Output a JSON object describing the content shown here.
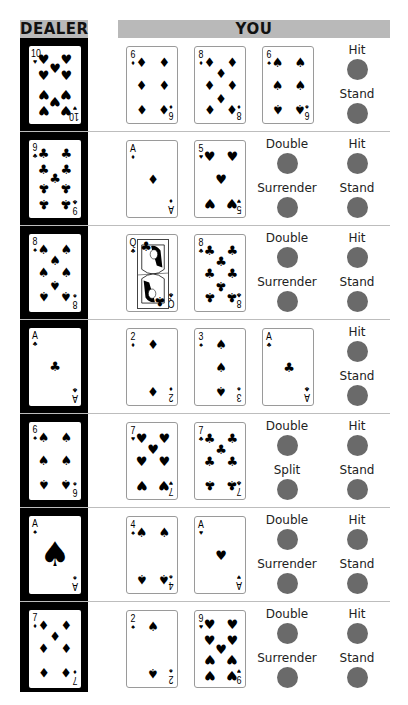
{
  "headers": {
    "dealer": "DEALER",
    "you": "YOU"
  },
  "colors": {
    "button": "#6a6a6a",
    "header_bg": "#b9b9b9",
    "dealer_bg": "#000000"
  },
  "suit_glyphs": {
    "hearts": "♥",
    "diamonds": "♦",
    "clubs": "♣",
    "spades": "♠"
  },
  "rows": [
    {
      "dealer": {
        "rank": "10",
        "suit": "hearts"
      },
      "player": [
        {
          "rank": "6",
          "suit": "diamonds"
        },
        {
          "rank": "8",
          "suit": "diamonds"
        },
        {
          "rank": "6",
          "suit": "spades"
        }
      ],
      "actions": [
        {
          "label": "Hit",
          "col": 1,
          "slot": 0
        },
        {
          "label": "Stand",
          "col": 1,
          "slot": 1
        }
      ]
    },
    {
      "dealer": {
        "rank": "9",
        "suit": "clubs"
      },
      "player": [
        {
          "rank": "A",
          "suit": "diamonds"
        },
        {
          "rank": "5",
          "suit": "hearts"
        }
      ],
      "actions": [
        {
          "label": "Double",
          "col": 0,
          "slot": 0
        },
        {
          "label": "Hit",
          "col": 1,
          "slot": 0
        },
        {
          "label": "Surrender",
          "col": 0,
          "slot": 1
        },
        {
          "label": "Stand",
          "col": 1,
          "slot": 1
        }
      ]
    },
    {
      "dealer": {
        "rank": "8",
        "suit": "spades"
      },
      "player": [
        {
          "rank": "Q",
          "suit": "clubs"
        },
        {
          "rank": "8",
          "suit": "clubs"
        }
      ],
      "actions": [
        {
          "label": "Double",
          "col": 0,
          "slot": 0
        },
        {
          "label": "Hit",
          "col": 1,
          "slot": 0
        },
        {
          "label": "Surrender",
          "col": 0,
          "slot": 1
        },
        {
          "label": "Stand",
          "col": 1,
          "slot": 1
        }
      ]
    },
    {
      "dealer": {
        "rank": "A",
        "suit": "clubs"
      },
      "player": [
        {
          "rank": "2",
          "suit": "diamonds"
        },
        {
          "rank": "3",
          "suit": "spades"
        },
        {
          "rank": "A",
          "suit": "clubs"
        }
      ],
      "actions": [
        {
          "label": "Hit",
          "col": 1,
          "slot": 0
        },
        {
          "label": "Stand",
          "col": 1,
          "slot": 1
        }
      ]
    },
    {
      "dealer": {
        "rank": "6",
        "suit": "spades"
      },
      "player": [
        {
          "rank": "7",
          "suit": "hearts"
        },
        {
          "rank": "7",
          "suit": "clubs"
        }
      ],
      "actions": [
        {
          "label": "Double",
          "col": 0,
          "slot": 0
        },
        {
          "label": "Hit",
          "col": 1,
          "slot": 0
        },
        {
          "label": "Split",
          "col": 0,
          "slot": 1
        },
        {
          "label": "Stand",
          "col": 1,
          "slot": 1
        }
      ]
    },
    {
      "dealer": {
        "rank": "A",
        "suit": "spades",
        "big_ace": true
      },
      "player": [
        {
          "rank": "4",
          "suit": "spades"
        },
        {
          "rank": "A",
          "suit": "hearts"
        }
      ],
      "actions": [
        {
          "label": "Double",
          "col": 0,
          "slot": 0
        },
        {
          "label": "Hit",
          "col": 1,
          "slot": 0
        },
        {
          "label": "Surrender",
          "col": 0,
          "slot": 1
        },
        {
          "label": "Stand",
          "col": 1,
          "slot": 1
        }
      ]
    },
    {
      "dealer": {
        "rank": "7",
        "suit": "diamonds"
      },
      "player": [
        {
          "rank": "2",
          "suit": "spades"
        },
        {
          "rank": "9",
          "suit": "hearts"
        }
      ],
      "actions": [
        {
          "label": "Double",
          "col": 0,
          "slot": 0
        },
        {
          "label": "Hit",
          "col": 1,
          "slot": 0
        },
        {
          "label": "Surrender",
          "col": 0,
          "slot": 1
        },
        {
          "label": "Stand",
          "col": 1,
          "slot": 1
        }
      ]
    }
  ]
}
